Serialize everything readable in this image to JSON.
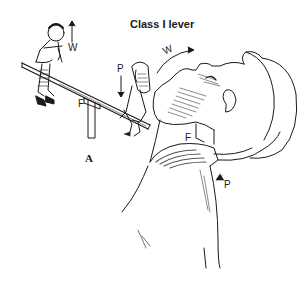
{
  "figure": {
    "title": "Class I lever",
    "panel_label": "A",
    "seesaw": {
      "weight_label": "W",
      "power_label": "P",
      "fulcrum_label": "F"
    },
    "head": {
      "weight_label": "W",
      "fulcrum_label": "F",
      "power_label": "P"
    }
  },
  "colors": {
    "ink": "#1a1a1a",
    "background": "#ffffff",
    "shade": "#555555"
  }
}
